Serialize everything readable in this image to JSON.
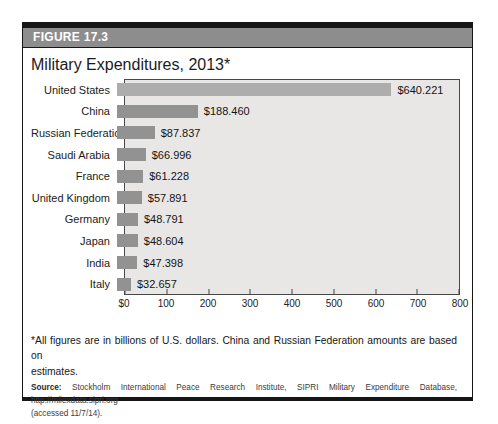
{
  "figure": {
    "label": "FIGURE 17.3",
    "title": "Military Expenditures, 2013*",
    "footnote_line1": "*All figures are in billions of U.S. dollars. China and Russian Federation amounts are based on",
    "footnote_line2": "estimates.",
    "source_label": "Source:",
    "source_rest": "Stockholm International Peace Research Institute, SIPRI Military Expenditure Database, http://milexdata.sipri.org",
    "source_line2": "(accessed 11/7/14)."
  },
  "colors": {
    "frame_black": "#161616",
    "header_bar": "#8d8d8d",
    "header_text": "#ffffff",
    "plot_background": "#e8e7e5",
    "plot_border": "#474747",
    "bar": "#929292",
    "bar_united_states": "#adadad",
    "text": "#1b1b1b"
  },
  "chart_data": {
    "type": "bar",
    "orientation": "horizontal",
    "title": "Military Expenditures, 2013*",
    "categories": [
      "United States",
      "China",
      "Russian Federation",
      "Saudi Arabia",
      "France",
      "United Kingdom",
      "Germany",
      "Japan",
      "India",
      "Italy"
    ],
    "values": [
      640.221,
      188.46,
      87.837,
      66.996,
      61.228,
      57.891,
      48.791,
      48.604,
      47.398,
      32.657
    ],
    "value_labels": [
      "$640.221",
      "$188.460",
      "$87.837",
      "$66.996",
      "$61.228",
      "$57.891",
      "$48.791",
      "$48.604",
      "$47.398",
      "$32.657"
    ],
    "xlabel": "",
    "ylabel": "",
    "xlim": [
      0,
      800
    ],
    "x_ticks": [
      "$0",
      "100",
      "200",
      "300",
      "400",
      "500",
      "600",
      "700",
      "800"
    ],
    "x_tick_values": [
      0,
      100,
      200,
      300,
      400,
      500,
      600,
      700,
      800
    ],
    "grid": false,
    "legend": false,
    "units_note": "billions of U.S. dollars"
  }
}
